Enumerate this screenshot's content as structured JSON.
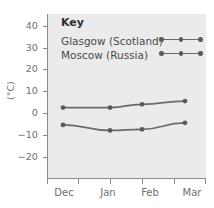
{
  "chart_data": {
    "type": "line",
    "title": "",
    "subtitle": "",
    "xlabel": "",
    "ylabel": "(°C)",
    "categories": [
      "Dec",
      "Jan",
      "Feb",
      "Mar"
    ],
    "xtick_labels": [
      "Dec",
      "Jan",
      "Feb",
      "Mar"
    ],
    "ytick_labels": [
      "40",
      "30",
      "20",
      "10",
      "0",
      "−10",
      "−20"
    ],
    "ytick_values": [
      40,
      30,
      20,
      10,
      0,
      -10,
      -20
    ],
    "ylim": [
      -25,
      45
    ],
    "grid": false,
    "legend_position": "top-left-inside",
    "legend_title": "Key",
    "series": [
      {
        "name": "Glasgow (Scotland)",
        "color": "#6b6b6b",
        "marker": "circle",
        "values": [
          2.5,
          2.5,
          4.0,
          5.5
        ]
      },
      {
        "name": "Moscow (Russia)",
        "color": "#6b6b6b",
        "marker": "circle",
        "values": [
          -5.5,
          -8.0,
          -7.5,
          -4.5
        ]
      }
    ],
    "plot_background": "#ebebeb",
    "axis_color": "#8c8c8c",
    "text_color": "#6e6e6e"
  },
  "legend": {
    "title": "Key",
    "entries": [
      {
        "label": "Glasgow (Scotland)"
      },
      {
        "label": "Moscow (Russia)"
      }
    ]
  },
  "axes": {
    "y_title": "(°C)",
    "y_labels": [
      "40",
      "30",
      "20",
      "10",
      "0",
      "−10",
      "−20"
    ],
    "x_labels": [
      "Dec",
      "Jan",
      "Feb",
      "Mar"
    ]
  }
}
